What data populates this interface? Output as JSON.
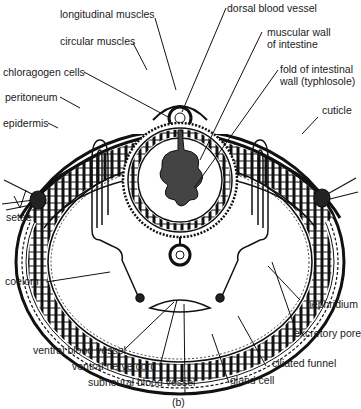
{
  "figure": {
    "caption": "(b)",
    "labels": {
      "longitudinal_muscles": "longitudinal muscles",
      "circular_muscles": "circular muscles",
      "chloragogen_cells": "chloragogen cells",
      "peritoneum": "peritoneum",
      "epidermis": "epidermis",
      "setae": "setae",
      "coelom": "coelom",
      "dorsal_blood_vessel": "dorsal blood vessel",
      "muscular_wall_1": "muscular wall",
      "muscular_wall_2": "of intestine",
      "fold_1": "fold of intestinal",
      "fold_2": "wall (typhlosole)",
      "cuticle": "cuticle",
      "nephridium": "nephridium",
      "excretory_pore": "excretory pore",
      "ciliated_funnel": "ciliated funnel",
      "gland_cell": "gland cell",
      "subneural_blood_vessel": "subneural blood vessel",
      "ventral_nerve_cord": "ventral nerve cord",
      "ventral_blood_vessel": "ventral blood vessel"
    }
  }
}
